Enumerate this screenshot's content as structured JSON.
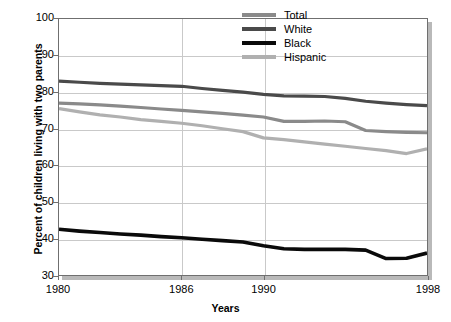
{
  "chart_data": {
    "type": "line",
    "title": "",
    "xlabel": "Years",
    "ylabel": "Percent of children living with two parents",
    "xlim": [
      1980,
      1998
    ],
    "ylim": [
      30,
      100
    ],
    "yticks": [
      30,
      40,
      50,
      60,
      70,
      80,
      90,
      100
    ],
    "xticks": [
      1980,
      1986,
      1990,
      1998
    ],
    "xticklabels": [
      "1980",
      "1986",
      "1990",
      "1998"
    ],
    "yticklabels": [
      "30",
      "40",
      "50",
      "60",
      "70",
      "80",
      "90",
      "100"
    ],
    "grid": true,
    "grid_axis": "both",
    "legend_position": "upper right",
    "x": [
      1980,
      1981,
      1982,
      1983,
      1984,
      1985,
      1986,
      1987,
      1988,
      1989,
      1990,
      1991,
      1992,
      1993,
      1994,
      1995,
      1996,
      1997,
      1998
    ],
    "series": [
      {
        "name": "Total",
        "color": "#8a8a8a",
        "values": [
          77.0,
          76.8,
          76.5,
          76.2,
          75.8,
          75.4,
          75.0,
          74.6,
          74.2,
          73.7,
          73.2,
          72.0,
          72.0,
          72.1,
          71.9,
          69.5,
          69.2,
          69.0,
          68.9
        ]
      },
      {
        "name": "White",
        "color": "#4a4a4a",
        "values": [
          83.0,
          82.7,
          82.4,
          82.2,
          82.0,
          81.8,
          81.6,
          81.0,
          80.5,
          80.0,
          79.4,
          79.0,
          78.9,
          78.8,
          78.3,
          77.5,
          77.0,
          76.6,
          76.3
        ]
      },
      {
        "name": "Black",
        "color": "#0a0a0a",
        "values": [
          42.5,
          42.0,
          41.6,
          41.2,
          40.9,
          40.5,
          40.2,
          39.8,
          39.4,
          39.0,
          38.0,
          37.2,
          37.0,
          37.0,
          37.0,
          36.8,
          34.5,
          34.6,
          36.0
        ]
      },
      {
        "name": "Hispanic",
        "color": "#b0b0b0",
        "values": [
          75.5,
          74.6,
          73.8,
          73.2,
          72.5,
          72.0,
          71.5,
          70.8,
          70.0,
          69.2,
          67.5,
          67.0,
          66.4,
          65.8,
          65.2,
          64.6,
          64.0,
          63.2,
          64.5
        ]
      }
    ]
  },
  "legend": {
    "items": [
      {
        "label": "Total",
        "color": "#8a8a8a"
      },
      {
        "label": "White",
        "color": "#4a4a4a"
      },
      {
        "label": "Black",
        "color": "#0a0a0a"
      },
      {
        "label": "Hispanic",
        "color": "#b0b0b0"
      }
    ]
  },
  "axes": {
    "y_title": "Percent of children living with two parents",
    "x_title": "Years"
  },
  "style": {
    "grid_color": "#c9c9c9",
    "frame_color": "#6f6f6f",
    "shadow_color": "#b9b9b9",
    "background": "#ffffff"
  }
}
